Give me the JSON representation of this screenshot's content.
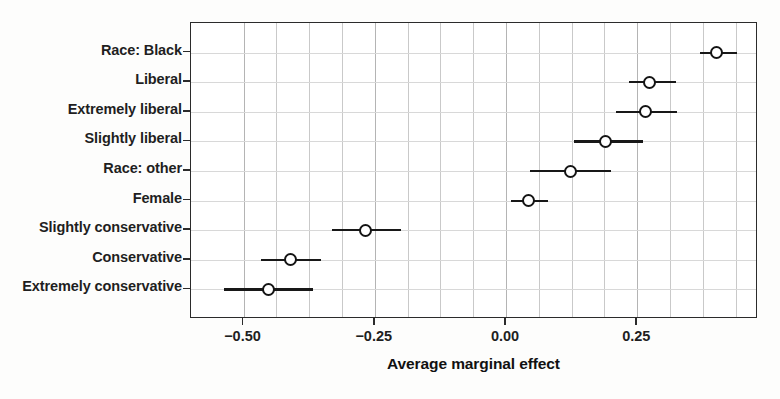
{
  "chart_data": {
    "type": "scatter",
    "title": "",
    "xlabel": "Average marginal effect",
    "ylabel": "",
    "xlim": [
      -0.6,
      0.48
    ],
    "ylim": [
      0,
      10
    ],
    "grid": true,
    "legend": false,
    "orientation": "horizontal",
    "marker": "open-circle",
    "error_bars": "confidence-interval",
    "xticks": [
      -0.5,
      -0.25,
      0.0,
      0.25
    ],
    "xticklabels": [
      "−0.50",
      "−0.25",
      "0.00",
      "0.25"
    ],
    "categories": [
      "Race: Black",
      "Liberal",
      "Extremely liberal",
      "Slightly liberal",
      "Race: other",
      "Female",
      "Slightly conservative",
      "Conservative",
      "Extremely conservative"
    ],
    "values": [
      0.4,
      0.273,
      0.266,
      0.19,
      0.123,
      0.043,
      -0.268,
      -0.411,
      -0.453
    ],
    "ci_low": [
      0.37,
      0.234,
      0.21,
      0.13,
      0.045,
      0.01,
      -0.332,
      -0.466,
      -0.538
    ],
    "ci_high": [
      0.44,
      0.324,
      0.325,
      0.26,
      0.2,
      0.08,
      -0.2,
      -0.353,
      -0.368
    ],
    "points": [
      {
        "label": "Race: Black",
        "value": 0.4,
        "ci_low": 0.37,
        "ci_high": 0.44
      },
      {
        "label": "Liberal",
        "value": 0.273,
        "ci_low": 0.234,
        "ci_high": 0.324
      },
      {
        "label": "Extremely liberal",
        "value": 0.266,
        "ci_low": 0.21,
        "ci_high": 0.325
      },
      {
        "label": "Slightly liberal",
        "value": 0.19,
        "ci_low": 0.13,
        "ci_high": 0.26
      },
      {
        "label": "Race: other",
        "value": 0.123,
        "ci_low": 0.045,
        "ci_high": 0.2
      },
      {
        "label": "Female",
        "value": 0.043,
        "ci_low": 0.01,
        "ci_high": 0.08
      },
      {
        "label": "Slightly conservative",
        "value": -0.268,
        "ci_low": -0.332,
        "ci_high": -0.2
      },
      {
        "label": "Conservative",
        "value": -0.411,
        "ci_low": -0.466,
        "ci_high": -0.353
      },
      {
        "label": "Extremely conservative",
        "value": -0.453,
        "ci_low": -0.538,
        "ci_high": -0.368
      }
    ],
    "gridlines_x": [
      -0.5,
      -0.4375,
      -0.375,
      -0.3125,
      -0.25,
      -0.1875,
      -0.125,
      -0.0625,
      0.0,
      0.0625,
      0.125,
      0.1875,
      0.25,
      0.3125,
      0.375,
      0.4375
    ],
    "colors": {
      "marker_stroke": "#141414",
      "error_bar": "#181818",
      "axis": "#2b2b2b",
      "gridline": "#c9c9c9",
      "text": "#1f1f1f",
      "background": "#ffffff"
    }
  }
}
